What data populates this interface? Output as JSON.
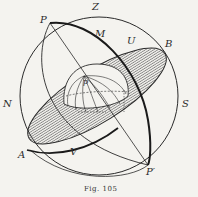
{
  "figure": {
    "caption": "Fig. 105",
    "labels": {
      "zenith": "Z",
      "pole": "P",
      "meridian": "M",
      "upper": "U",
      "b_point": "B",
      "north": "N",
      "south": "S",
      "a_point": "A",
      "v_point": "V",
      "pole_prime": "P′",
      "earth_pole": "p"
    },
    "colors": {
      "background": "#f4f3ef",
      "ink": "#2a2a2a",
      "hatch": "#555555"
    }
  }
}
